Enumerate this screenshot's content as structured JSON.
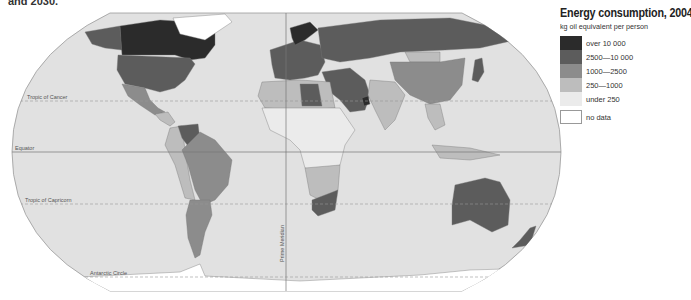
{
  "header_fragment": "and 2030.",
  "legend": {
    "title": "Energy consumption, 2004",
    "subtitle": "kg oil equivalent per person",
    "classes": [
      {
        "label": "over 10 000",
        "color": "#2b2b2b"
      },
      {
        "label": "2500—10 000",
        "color": "#5c5c5c"
      },
      {
        "label": "1000—2500",
        "color": "#8c8c8c"
      },
      {
        "label": "250—1000",
        "color": "#bdbdbd"
      },
      {
        "label": "under 250",
        "color": "#ebebeb"
      }
    ],
    "no_data": {
      "label": "no data",
      "color": "#ffffff"
    }
  },
  "map": {
    "ocean_color": "#e1e1e1",
    "line_color": "#8a8a8a",
    "lines": {
      "tropic_cancer": "Tropic of Cancer",
      "equator": "Equator",
      "tropic_capricorn": "Tropic of Capricorn",
      "antarctic_circle": "Antarctic Circle",
      "prime_meridian": "Prime Meridian"
    },
    "regions": [
      {
        "name": "Canada",
        "class": "over 10 000"
      },
      {
        "name": "Greenland",
        "class": "no data"
      },
      {
        "name": "Alaska",
        "class": "2500—10 000"
      },
      {
        "name": "United States",
        "class": "2500—10 000"
      },
      {
        "name": "Mexico",
        "class": "1000—2500"
      },
      {
        "name": "Central America",
        "class": "250—1000"
      },
      {
        "name": "Venezuela",
        "class": "2500—10 000"
      },
      {
        "name": "Brazil",
        "class": "1000—2500"
      },
      {
        "name": "Argentina",
        "class": "1000—2500"
      },
      {
        "name": "Andes",
        "class": "250—1000"
      },
      {
        "name": "Russia",
        "class": "2500—10 000"
      },
      {
        "name": "Europe",
        "class": "2500—10 000"
      },
      {
        "name": "Scandinavia",
        "class": "over 10 000"
      },
      {
        "name": "North Africa",
        "class": "250—1000"
      },
      {
        "name": "Libya",
        "class": "2500—10 000"
      },
      {
        "name": "Sub-Saharan Africa",
        "class": "under 250"
      },
      {
        "name": "Southern Africa",
        "class": "250—1000"
      },
      {
        "name": "South Africa",
        "class": "2500—10 000"
      },
      {
        "name": "Middle East",
        "class": "2500—10 000"
      },
      {
        "name": "Gulf States",
        "class": "over 10 000"
      },
      {
        "name": "China",
        "class": "1000—2500"
      },
      {
        "name": "Mongolia",
        "class": "250—1000"
      },
      {
        "name": "India",
        "class": "250—1000"
      },
      {
        "name": "Southeast Asia",
        "class": "250—1000"
      },
      {
        "name": "Japan",
        "class": "2500—10 000"
      },
      {
        "name": "Indonesia",
        "class": "250—1000"
      },
      {
        "name": "Australia",
        "class": "2500—10 000"
      },
      {
        "name": "New Zealand",
        "class": "2500—10 000"
      },
      {
        "name": "Antarctica",
        "class": "no data"
      }
    ]
  }
}
